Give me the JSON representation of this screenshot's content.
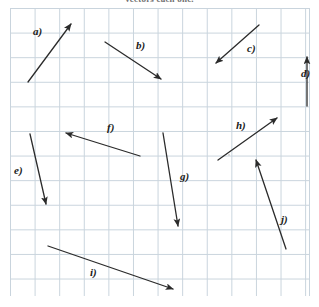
{
  "header": {
    "cropped_text": "vectors each one."
  },
  "grid": {
    "cell_size_px": 24.6,
    "origin_x_px": 10,
    "origin_y_px": 8,
    "width_px": 299,
    "height_px": 288,
    "line_color": "#c9d4dd",
    "background_color": "#ffffff",
    "columns": 12,
    "rows": 12
  },
  "style": {
    "arrow_color": "#2b2b2b",
    "arrow_stroke_width": 1.3,
    "label_color": "#1a1a1a"
  },
  "chart_data": {
    "type": "scatter",
    "title": "vectors each one.",
    "xlabel": "",
    "ylabel": "",
    "xlim": [
      0,
      319
    ],
    "ylim": [
      307,
      0
    ],
    "grid": true,
    "legend": "none",
    "series": [
      {
        "name": "vector-a",
        "label": "a)",
        "tail": [
          28,
          82
        ],
        "head": [
          71,
          24
        ],
        "dx": 43,
        "dy": -58,
        "label_x": 33,
        "label_y": 26
      },
      {
        "name": "vector-b",
        "label": "b)",
        "tail": [
          105,
          42
        ],
        "head": [
          161,
          79
        ],
        "dx": 56,
        "dy": 37,
        "label_x": 136,
        "label_y": 40
      },
      {
        "name": "vector-c",
        "label": "c)",
        "tail": [
          259,
          25
        ],
        "head": [
          216,
          63
        ],
        "dx": -43,
        "dy": 38,
        "label_x": 247,
        "label_y": 43
      },
      {
        "name": "vector-d",
        "label": "d)",
        "tail": [
          307,
          106
        ],
        "head": [
          307,
          57
        ],
        "dx": 0,
        "dy": -49,
        "label_x": 301,
        "label_y": 68
      },
      {
        "name": "vector-e",
        "label": "e)",
        "tail": [
          30,
          134
        ],
        "head": [
          46,
          204
        ],
        "dx": 16,
        "dy": 70,
        "label_x": 14,
        "label_y": 165
      },
      {
        "name": "vector-f",
        "label": "f)",
        "tail": [
          140,
          156
        ],
        "head": [
          66,
          133
        ],
        "dx": -74,
        "dy": -23,
        "label_x": 107,
        "label_y": 122
      },
      {
        "name": "vector-g",
        "label": "g)",
        "tail": [
          163,
          133
        ],
        "head": [
          178,
          226
        ],
        "dx": 15,
        "dy": 93,
        "label_x": 180,
        "label_y": 171
      },
      {
        "name": "vector-h",
        "label": "h)",
        "tail": [
          218,
          160
        ],
        "head": [
          277,
          118
        ],
        "dx": 59,
        "dy": -42,
        "label_x": 236,
        "label_y": 120
      },
      {
        "name": "vector-i",
        "label": "i)",
        "tail": [
          48,
          246
        ],
        "head": [
          173,
          289
        ],
        "dx": 125,
        "dy": 43,
        "label_x": 90,
        "label_y": 267
      },
      {
        "name": "vector-j",
        "label": "j)",
        "tail": [
          286,
          249
        ],
        "head": [
          256,
          160
        ],
        "dx": -30,
        "dy": -89,
        "label_x": 281,
        "label_y": 214
      }
    ]
  }
}
